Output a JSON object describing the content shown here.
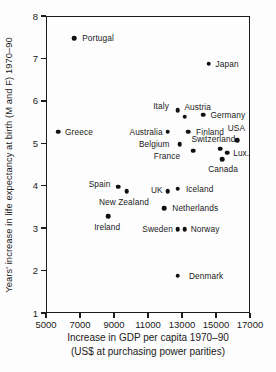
{
  "chart_data": {
    "type": "scatter",
    "title": "",
    "xlabel": "Increase in GDP per capita 1970–90",
    "xlabel_sub": "(US$ at purchasing power parities)",
    "ylabel": "Years' increase in life expectancy at birth (M and F) 1970–90",
    "xlim": [
      5000,
      17000
    ],
    "ylim": [
      1,
      8
    ],
    "x_ticks": [
      5000,
      7000,
      9000,
      11000,
      13000,
      15000,
      17000
    ],
    "y_ticks": [
      1,
      2,
      3,
      4,
      5,
      6,
      7,
      8
    ],
    "grid": false,
    "legend": "none",
    "marker": "filled-black-circle",
    "points": [
      {
        "name": "Portugal",
        "x": 6600,
        "y": 7.5,
        "label": "right",
        "dx": 3,
        "dy": 0
      },
      {
        "name": "Japan",
        "x": 14500,
        "y": 6.9,
        "label": "right",
        "dx": 2,
        "dy": 0
      },
      {
        "name": "Italy",
        "x": 12700,
        "y": 5.8,
        "label": "left",
        "dx": -4,
        "dy": -4
      },
      {
        "name": "Austria",
        "x": 13100,
        "y": 5.65,
        "label": "above",
        "dx": 13,
        "dy": -1
      },
      {
        "name": "Germany",
        "x": 14200,
        "y": 5.7,
        "label": "right",
        "dx": 2,
        "dy": 0
      },
      {
        "name": "Greece",
        "x": 5650,
        "y": 5.3,
        "label": "right",
        "dx": 2,
        "dy": 0
      },
      {
        "name": "Australia",
        "x": 12100,
        "y": 5.3,
        "label": "left",
        "dx": 0,
        "dy": 0
      },
      {
        "name": "Finland",
        "x": 13300,
        "y": 5.3,
        "label": "right",
        "dx": 3,
        "dy": 0
      },
      {
        "name": "USA",
        "x": 16200,
        "y": 5.1,
        "label": "above",
        "dx": -1,
        "dy": -3
      },
      {
        "name": "Belgium",
        "x": 12800,
        "y": 5.0,
        "label": "left",
        "dx": -5,
        "dy": 0
      },
      {
        "name": "Switzerland",
        "x": 15200,
        "y": 4.9,
        "label": "above",
        "dx": -7,
        "dy": -1
      },
      {
        "name": "France",
        "x": 13600,
        "y": 4.85,
        "label": "left",
        "dx": -8,
        "dy": 5
      },
      {
        "name": "Lux.",
        "x": 15600,
        "y": 4.8,
        "label": "right",
        "dx": 1,
        "dy": 0
      },
      {
        "name": "Canada",
        "x": 15300,
        "y": 4.65,
        "label": "below",
        "dx": 1,
        "dy": 1
      },
      {
        "name": "Spain",
        "x": 9200,
        "y": 4.0,
        "label": "left",
        "dx": -3,
        "dy": -3
      },
      {
        "name": "New Zealand",
        "x": 9700,
        "y": 3.9,
        "label": "below",
        "dx": -3,
        "dy": 2
      },
      {
        "name": "UK",
        "x": 12100,
        "y": 3.9,
        "label": "left",
        "dx": 0,
        "dy": -1
      },
      {
        "name": "Iceland",
        "x": 12700,
        "y": 3.95,
        "label": "right",
        "dx": 3,
        "dy": 0
      },
      {
        "name": "Netherlands",
        "x": 11900,
        "y": 3.5,
        "label": "right",
        "dx": 3,
        "dy": 0
      },
      {
        "name": "Ireland",
        "x": 8600,
        "y": 3.3,
        "label": "below",
        "dx": -1,
        "dy": 2
      },
      {
        "name": "Sweden",
        "x": 12700,
        "y": 3.0,
        "label": "left",
        "dx": 0,
        "dy": 0
      },
      {
        "name": "Norway",
        "x": 13100,
        "y": 3.0,
        "label": "right",
        "dx": 1,
        "dy": 0
      },
      {
        "name": "Denmark",
        "x": 12700,
        "y": 1.9,
        "label": "right",
        "dx": 6,
        "dy": 0
      }
    ]
  },
  "colors": {
    "ink": "#1a1a1a",
    "background": "#fdfdfd"
  }
}
